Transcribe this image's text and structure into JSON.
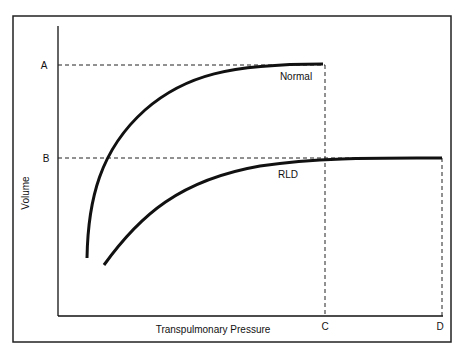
{
  "diagram": {
    "y_axis_label": "Volume",
    "x_axis_label": "Transpulmonary Pressure",
    "y_ticks": [
      "A",
      "B"
    ],
    "x_ticks": [
      "C",
      "D"
    ],
    "curves": [
      {
        "name": "Normal",
        "plateau": "A",
        "pressure_at_plateau": "C"
      },
      {
        "name": "RLD",
        "plateau": "B",
        "pressure_at_plateau": "D"
      }
    ],
    "colors": {
      "line": "#111111",
      "background": "#ffffff"
    }
  }
}
